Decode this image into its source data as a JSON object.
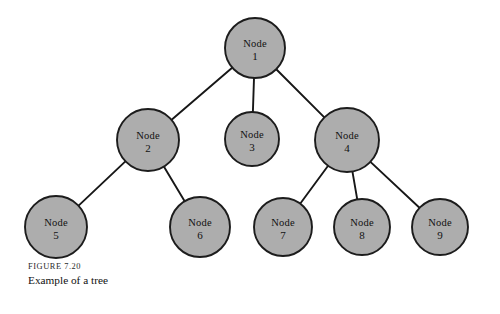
{
  "figure": {
    "number_label": "FIGURE 7.20",
    "title": "Example of a tree",
    "background_color": "#ffffff",
    "node_fill_color": "#adadad",
    "node_stroke_color": "#1c1c1c",
    "edge_color": "#171717"
  },
  "chart_data": {
    "type": "diagram",
    "diagram_kind": "tree",
    "title": "Example of a tree",
    "nodes": [
      {
        "id": 1,
        "word": "Node",
        "number": "1",
        "cx": 255,
        "cy": 48,
        "r": 30,
        "level": 0
      },
      {
        "id": 2,
        "word": "Node",
        "number": "2",
        "cx": 148,
        "cy": 140,
        "r": 31,
        "level": 1
      },
      {
        "id": 3,
        "word": "Node",
        "number": "3",
        "cx": 252,
        "cy": 139,
        "r": 27,
        "level": 1
      },
      {
        "id": 4,
        "word": "Node",
        "number": "4",
        "cx": 347,
        "cy": 140,
        "r": 32,
        "level": 1
      },
      {
        "id": 5,
        "word": "Node",
        "number": "5",
        "cx": 56,
        "cy": 227,
        "r": 31,
        "level": 2
      },
      {
        "id": 6,
        "word": "Node",
        "number": "6",
        "cx": 200,
        "cy": 227,
        "r": 30,
        "level": 2
      },
      {
        "id": 7,
        "word": "Node",
        "number": "7",
        "cx": 283,
        "cy": 227,
        "r": 29,
        "level": 2
      },
      {
        "id": 8,
        "word": "Node",
        "number": "8",
        "cx": 362,
        "cy": 227,
        "r": 28,
        "level": 2
      },
      {
        "id": 9,
        "word": "Node",
        "number": "9",
        "cx": 440,
        "cy": 227,
        "r": 28,
        "level": 2
      }
    ],
    "edges": [
      {
        "from": 1,
        "to": 2
      },
      {
        "from": 1,
        "to": 3
      },
      {
        "from": 1,
        "to": 4
      },
      {
        "from": 2,
        "to": 5
      },
      {
        "from": 2,
        "to": 6
      },
      {
        "from": 4,
        "to": 7
      },
      {
        "from": 4,
        "to": 8
      },
      {
        "from": 4,
        "to": 9
      }
    ],
    "node_count": 9,
    "edge_count": 8,
    "root": 1,
    "leaves": [
      3,
      5,
      6,
      7,
      8,
      9
    ]
  }
}
